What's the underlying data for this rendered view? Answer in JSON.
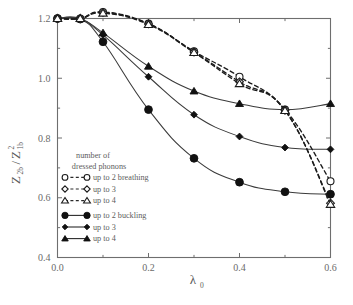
{
  "figure": {
    "background_color": "#ffffff",
    "frame_color": "#6e6e6e"
  },
  "chart_data": {
    "type": "line",
    "title": "",
    "subtitle": "",
    "xlabel": "λ",
    "xlabel_sub": "0",
    "ylabel_main": "Z",
    "ylabel_num_sub": "2b",
    "ylabel_den": "Z",
    "ylabel_den_sub": "1b",
    "ylabel_den_sup": "2",
    "xlim": [
      0.0,
      0.6
    ],
    "ylim": [
      0.4,
      1.2
    ],
    "grid": false,
    "xticks": [
      0.0,
      0.2,
      0.4,
      0.6
    ],
    "xtick_labels": [
      "0.0",
      "0.2",
      "0.4",
      "0.6"
    ],
    "xticks_minor": [
      0.1,
      0.3,
      0.5
    ],
    "yticks": [
      0.4,
      0.6,
      0.8,
      1.0,
      1.2
    ],
    "ytick_labels": [
      "0.4",
      "0.6",
      "0.8",
      "1.0",
      "1.2"
    ],
    "yticks_minor": [
      0.5,
      0.7,
      0.9,
      1.1
    ],
    "legend_position": "inner-left",
    "legend_title_line1": "number of",
    "legend_title_line2": "dressed phonons",
    "x": [
      0.0,
      0.05,
      0.1,
      0.2,
      0.3,
      0.4,
      0.5,
      0.6
    ],
    "series": [
      {
        "name": "up to 2 breathing",
        "marker": "open-circle",
        "linestyle": "dashed",
        "values": [
          1.2,
          1.2,
          1.222,
          1.183,
          1.09,
          1.005,
          0.895,
          0.655
        ]
      },
      {
        "name": "up to 3",
        "marker": "open-diamond",
        "linestyle": "dashed",
        "values": [
          1.2,
          1.2,
          1.22,
          1.182,
          1.088,
          0.988,
          0.893,
          0.582
        ]
      },
      {
        "name": "up to 4",
        "marker": "open-triangle",
        "linestyle": "dashed",
        "values": [
          1.2,
          1.2,
          1.218,
          1.18,
          1.086,
          0.982,
          0.892,
          0.578
        ]
      },
      {
        "name": "up to 2 buckling",
        "marker": "filled-circle",
        "linestyle": "solid",
        "values": [
          1.2,
          1.198,
          1.122,
          0.895,
          0.732,
          0.652,
          0.62,
          0.612
        ]
      },
      {
        "name": "up to 3",
        "marker": "filled-diamond",
        "linestyle": "solid",
        "values": [
          1.2,
          1.198,
          1.145,
          1.005,
          0.878,
          0.805,
          0.768,
          0.762
        ]
      },
      {
        "name": "up to 4",
        "marker": "filled-triangle",
        "linestyle": "solid",
        "values": [
          1.2,
          1.199,
          1.152,
          1.04,
          0.957,
          0.915,
          0.895,
          0.915
        ]
      }
    ]
  }
}
